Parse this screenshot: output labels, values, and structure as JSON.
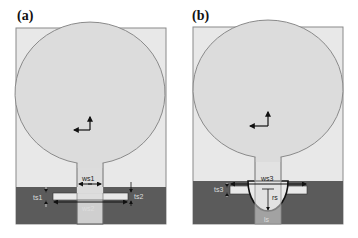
{
  "panels": [
    {
      "label": "(a)",
      "dims": {
        "w_top": "ws1",
        "w_top_sub": "1",
        "w_bottom": "ws2",
        "w_bottom_sub": "2",
        "t_left": "ts1",
        "t_right": "ts2"
      }
    },
    {
      "label": "(b)",
      "dims": {
        "w_top": "ws3",
        "r": "rs",
        "t_left": "ts3",
        "l_bottom": "ls"
      }
    }
  ],
  "colors": {
    "background": "#ffffff",
    "substrate": "#e8e8e8",
    "patch": "#dcdcdc",
    "outline": "#8a8a8a",
    "ground": "#5b5b5b",
    "slot": "#e9e9e9",
    "arrow": "#111111"
  }
}
